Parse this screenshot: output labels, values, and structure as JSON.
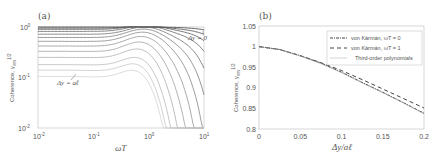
{
  "chart_data": [
    {
      "panel": "(a)",
      "type": "line",
      "xscale": "log",
      "yscale": "log",
      "xlabel": "ωT",
      "ylabel": "Coherence, γww^1/2",
      "xlim": [
        0.01,
        10
      ],
      "ylim": [
        0.01,
        1
      ],
      "xticks": [
        "10^-2",
        "10^-1",
        "10^0",
        "10^1"
      ],
      "yticks": [
        "10^-2",
        "10^-1",
        "10^0"
      ],
      "annotations": [
        {
          "text": "Δy = 0",
          "near": "top-right curve"
        },
        {
          "text": "Δy = aℓ",
          "near": "lowest curve"
        }
      ],
      "series_description": "Family of coherence curves for Δy from 0 to aℓ; low-frequency plateau levels listed, each rolling off above ωT≈1",
      "plateaus": [
        1.0,
        0.95,
        0.9,
        0.82,
        0.72,
        0.62,
        0.52,
        0.42,
        0.33,
        0.25,
        0.18,
        0.14,
        0.105
      ],
      "grid": false
    },
    {
      "panel": "(b)",
      "type": "line",
      "xlabel": "Δy/aℓ",
      "ylabel": "Coherence, γww^1/2",
      "xlim": [
        0,
        0.2
      ],
      "ylim": [
        0.8,
        1.05
      ],
      "xticks": [
        "0",
        "0.05",
        "0.1",
        "0.15",
        "0.2"
      ],
      "yticks": [
        "0.8",
        "0.85",
        "0.9",
        "0.95",
        "1",
        "1.05"
      ],
      "legend_position": "upper right",
      "x": [
        0,
        0.025,
        0.05,
        0.075,
        0.1,
        0.125,
        0.15,
        0.175,
        0.2
      ],
      "series": [
        {
          "name": "von Kármán, ωT = 0",
          "style": "dash-dot",
          "values": [
            1.0,
            0.993,
            0.978,
            0.96,
            0.938,
            0.913,
            0.889,
            0.864,
            0.838
          ]
        },
        {
          "name": "von Kármán, ωT = 1",
          "style": "dashed",
          "values": [
            1.0,
            0.993,
            0.978,
            0.961,
            0.942,
            0.92,
            0.897,
            0.874,
            0.851
          ]
        },
        {
          "name": "Third-order polynomials",
          "style": "solid-thin",
          "values": [
            1.0,
            0.993,
            0.977,
            0.959,
            0.937,
            0.912,
            0.888,
            0.863,
            0.837
          ]
        }
      ],
      "grid": false
    }
  ]
}
